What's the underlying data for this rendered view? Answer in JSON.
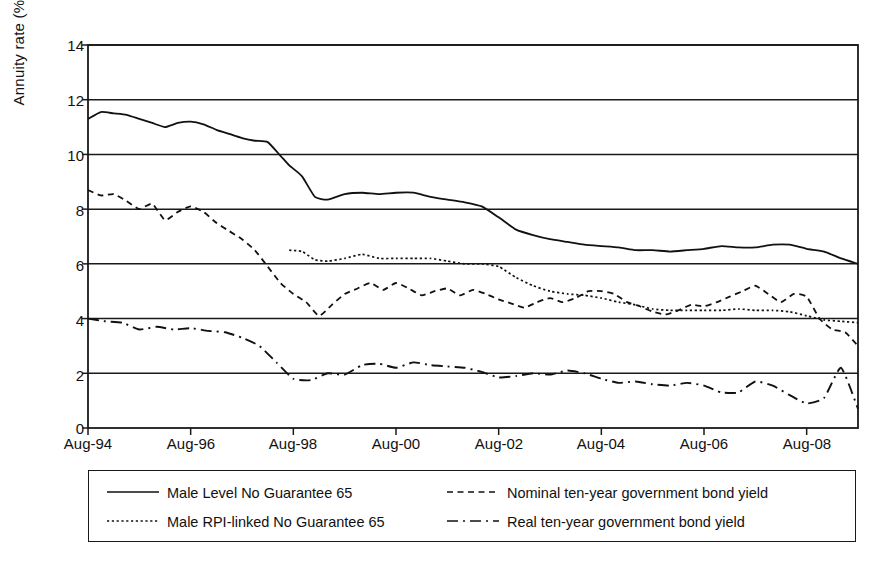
{
  "chart_data": {
    "type": "line",
    "title": "",
    "xlabel": "",
    "ylabel": "Annuity rate (%)",
    "ylim": [
      0,
      14
    ],
    "yticks": [
      0,
      2,
      4,
      6,
      8,
      10,
      12,
      14
    ],
    "ytick_labels": [
      "0",
      "2",
      "4",
      "6",
      "8",
      "10",
      "12",
      "14"
    ],
    "xtick_labels": [
      "Aug-94",
      "Aug-96",
      "Aug-98",
      "Aug-00",
      "Aug-02",
      "Aug-04",
      "Aug-06",
      "Aug-08"
    ],
    "xtick_values": [
      1994.58,
      1996.58,
      1998.58,
      2000.58,
      2002.58,
      2004.58,
      2006.58,
      2008.58
    ],
    "xlim": [
      1994.58,
      2009.58
    ],
    "grid": true,
    "legend_position": "below-plot",
    "series": [
      {
        "name": "Male Level No Guarantee 65",
        "style": "solid",
        "x": [
          1994.58,
          1994.83,
          1995.08,
          1995.33,
          1995.58,
          1995.83,
          1996.08,
          1996.33,
          1996.58,
          1996.83,
          1997.08,
          1997.33,
          1997.58,
          1997.83,
          1998.08,
          1998.33,
          1998.5,
          1998.75,
          1999.0,
          1999.25,
          1999.58,
          1999.92,
          2000.25,
          2000.58,
          2000.92,
          2001.25,
          2001.58,
          2001.92,
          2002.25,
          2002.58,
          2002.92,
          2003.25,
          2003.58,
          2003.92,
          2004.25,
          2004.58,
          2004.92,
          2005.25,
          2005.58,
          2005.92,
          2006.25,
          2006.58,
          2006.92,
          2007.25,
          2007.58,
          2007.92,
          2008.25,
          2008.58,
          2008.92,
          2009.25,
          2009.58
        ],
        "y": [
          11.3,
          11.55,
          11.5,
          11.45,
          11.3,
          11.15,
          11.0,
          11.15,
          11.2,
          11.1,
          10.9,
          10.75,
          10.6,
          10.5,
          10.45,
          9.95,
          9.6,
          9.2,
          8.45,
          8.35,
          8.55,
          8.6,
          8.55,
          8.6,
          8.6,
          8.45,
          8.35,
          8.25,
          8.1,
          7.7,
          7.25,
          7.05,
          6.9,
          6.8,
          6.7,
          6.65,
          6.6,
          6.5,
          6.5,
          6.45,
          6.5,
          6.55,
          6.65,
          6.6,
          6.6,
          6.7,
          6.7,
          6.55,
          6.45,
          6.2,
          6.0
        ]
      },
      {
        "name": "Male RPI-linked No Guarantee 65",
        "style": "dotted",
        "x": [
          1998.5,
          1998.75,
          1999.0,
          1999.25,
          1999.58,
          1999.92,
          2000.25,
          2000.58,
          2000.92,
          2001.25,
          2001.58,
          2001.92,
          2002.25,
          2002.58,
          2002.92,
          2003.25,
          2003.58,
          2003.92,
          2004.25,
          2004.58,
          2004.92,
          2005.25,
          2005.58,
          2005.92,
          2006.25,
          2006.58,
          2006.92,
          2007.25,
          2007.58,
          2007.92,
          2008.25,
          2008.58,
          2008.92,
          2009.25,
          2009.58
        ],
        "y": [
          6.5,
          6.45,
          6.15,
          6.1,
          6.2,
          6.35,
          6.2,
          6.2,
          6.2,
          6.2,
          6.1,
          6.0,
          6.0,
          5.9,
          5.5,
          5.2,
          5.0,
          4.9,
          4.85,
          4.75,
          4.6,
          4.5,
          4.35,
          4.3,
          4.3,
          4.3,
          4.3,
          4.35,
          4.3,
          4.3,
          4.25,
          4.1,
          3.95,
          3.9,
          3.85
        ]
      },
      {
        "name": "Nominal ten-year government bond yield",
        "style": "dashed",
        "x": [
          1994.58,
          1994.83,
          1995.08,
          1995.33,
          1995.58,
          1995.83,
          1996.08,
          1996.33,
          1996.58,
          1996.83,
          1997.08,
          1997.33,
          1997.58,
          1997.83,
          1998.08,
          1998.33,
          1998.58,
          1998.83,
          1999.08,
          1999.33,
          1999.58,
          1999.83,
          2000.08,
          2000.33,
          2000.58,
          2000.83,
          2001.08,
          2001.33,
          2001.58,
          2001.83,
          2002.08,
          2002.33,
          2002.58,
          2002.83,
          2003.08,
          2003.33,
          2003.58,
          2003.83,
          2004.08,
          2004.33,
          2004.58,
          2004.83,
          2005.08,
          2005.33,
          2005.58,
          2005.83,
          2006.08,
          2006.33,
          2006.58,
          2006.83,
          2007.08,
          2007.33,
          2007.58,
          2007.83,
          2008.08,
          2008.33,
          2008.58,
          2008.83,
          2009.08,
          2009.33,
          2009.58
        ],
        "y": [
          8.7,
          8.5,
          8.55,
          8.3,
          8.0,
          8.2,
          7.6,
          7.9,
          8.1,
          7.9,
          7.5,
          7.2,
          6.9,
          6.5,
          5.9,
          5.3,
          4.9,
          4.6,
          4.1,
          4.5,
          4.9,
          5.1,
          5.3,
          5.05,
          5.3,
          5.1,
          4.85,
          5.0,
          5.1,
          4.85,
          5.05,
          4.9,
          4.7,
          4.55,
          4.4,
          4.6,
          4.75,
          4.6,
          4.75,
          5.0,
          5.0,
          4.9,
          4.6,
          4.45,
          4.25,
          4.15,
          4.3,
          4.5,
          4.45,
          4.6,
          4.8,
          5.0,
          5.2,
          4.9,
          4.6,
          4.9,
          4.8,
          4.0,
          3.6,
          3.5,
          3.0
        ]
      },
      {
        "name": "Real ten-year government bond yield",
        "style": "dashdot",
        "x": [
          1994.58,
          1994.92,
          1995.25,
          1995.58,
          1995.92,
          1996.25,
          1996.58,
          1996.92,
          1997.25,
          1997.58,
          1997.92,
          1998.25,
          1998.58,
          1998.92,
          1999.25,
          1999.58,
          1999.92,
          2000.25,
          2000.58,
          2000.92,
          2001.25,
          2001.58,
          2001.92,
          2002.25,
          2002.58,
          2002.92,
          2003.25,
          2003.58,
          2003.92,
          2004.25,
          2004.58,
          2004.92,
          2005.25,
          2005.58,
          2005.92,
          2006.25,
          2006.58,
          2006.92,
          2007.25,
          2007.58,
          2007.92,
          2008.25,
          2008.58,
          2008.92,
          2009.25,
          2009.58
        ],
        "y": [
          4.0,
          3.9,
          3.85,
          3.6,
          3.7,
          3.6,
          3.65,
          3.55,
          3.5,
          3.3,
          3.0,
          2.4,
          1.8,
          1.75,
          2.0,
          1.95,
          2.3,
          2.35,
          2.2,
          2.4,
          2.3,
          2.25,
          2.2,
          2.05,
          1.85,
          1.9,
          2.0,
          1.95,
          2.1,
          2.0,
          1.8,
          1.65,
          1.7,
          1.6,
          1.55,
          1.65,
          1.55,
          1.3,
          1.3,
          1.7,
          1.55,
          1.2,
          0.9,
          1.1,
          2.2,
          0.7
        ]
      }
    ]
  },
  "legend": {
    "entries": [
      {
        "label": "Male Level No Guarantee 65",
        "style": "solid"
      },
      {
        "label": "Male RPI-linked No Guarantee 65",
        "style": "dotted"
      },
      {
        "label": "Nominal ten-year government bond yield",
        "style": "dashed"
      },
      {
        "label": "Real ten-year government bond yield",
        "style": "dashdot"
      }
    ]
  }
}
